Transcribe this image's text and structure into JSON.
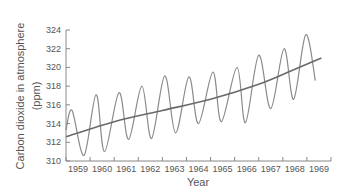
{
  "chart_data": {
    "type": "line",
    "title": "",
    "xlabel": "Year",
    "ylabel": "Carbon dioxide in atmosphere",
    "ylabel_units": "(ppm)",
    "xlim": [
      1958.5,
      1969.5
    ],
    "ylim": [
      310,
      324
    ],
    "grid": false,
    "legend": null,
    "x_tick_labels": [
      "1959",
      "1960",
      "1961",
      "1962",
      "1963",
      "1964",
      "1965",
      "1966",
      "1967",
      "1968",
      "1969"
    ],
    "y_tick_labels": [
      "310",
      "312",
      "314",
      "316",
      "318",
      "320",
      "322",
      "324"
    ],
    "series": [
      {
        "name": "Monthly CO2 (seasonal oscillation)",
        "color": "#8a8a8a",
        "points": [
          [
            1958.5,
            313.3
          ],
          [
            1958.75,
            315.4
          ],
          [
            1959.25,
            310.6
          ],
          [
            1959.75,
            317.1
          ],
          [
            1960.1,
            311.0
          ],
          [
            1960.7,
            317.3
          ],
          [
            1961.1,
            312.3
          ],
          [
            1961.65,
            318.0
          ],
          [
            1962.05,
            312.4
          ],
          [
            1962.6,
            319.1
          ],
          [
            1963.05,
            313.0
          ],
          [
            1963.6,
            319.0
          ],
          [
            1964.0,
            314.0
          ],
          [
            1964.6,
            319.5
          ],
          [
            1964.95,
            314.2
          ],
          [
            1965.6,
            320.0
          ],
          [
            1965.95,
            314.1
          ],
          [
            1966.5,
            321.3
          ],
          [
            1967.0,
            315.6
          ],
          [
            1967.55,
            322.0
          ],
          [
            1967.95,
            316.6
          ],
          [
            1968.45,
            323.5
          ],
          [
            1968.85,
            318.6
          ]
        ]
      },
      {
        "name": "Trend",
        "color": "#6a6a6a",
        "points": [
          [
            1958.5,
            312.6
          ],
          [
            1960.5,
            314.2
          ],
          [
            1962.5,
            315.4
          ],
          [
            1964.5,
            316.6
          ],
          [
            1966.5,
            318.2
          ],
          [
            1968.0,
            319.8
          ],
          [
            1969.1,
            321.0
          ]
        ]
      }
    ]
  }
}
